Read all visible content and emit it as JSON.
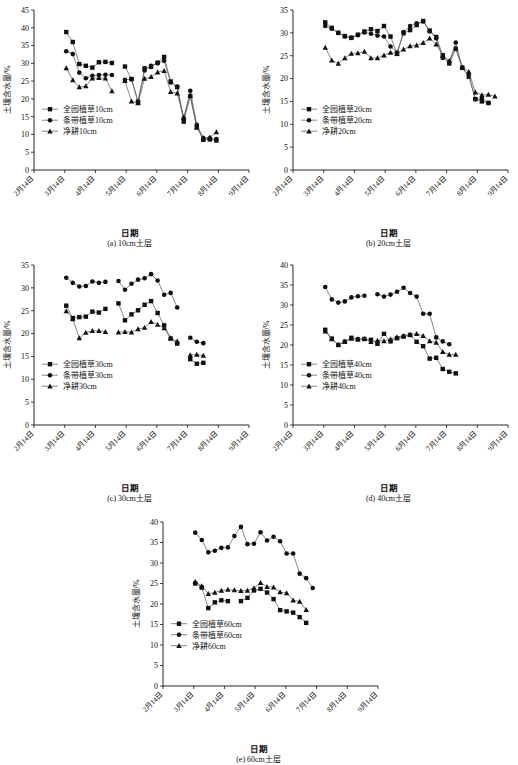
{
  "figure": {
    "axis_y_label": "土壤含水量/%",
    "axis_x_label": "日期",
    "xtick_labels": [
      "2月14日",
      "3月14日",
      "4月14日",
      "5月14日",
      "6月14日",
      "7月14日",
      "8月14日",
      "9月14日"
    ]
  },
  "chart_data": [
    {
      "type": "line",
      "panel": "a",
      "caption": "(a) 10cm土层",
      "title": "",
      "xlabel": "日期",
      "ylabel": "土壤含水量/%",
      "ylim": [
        0,
        45
      ],
      "ytick_step": 5,
      "grid": false,
      "legend_position": "lower-left",
      "categories": [
        "2月14日",
        "3月14日",
        "4月14日",
        "5月14日",
        "6月14日",
        "7月14日",
        "8月14日",
        "9月14日"
      ],
      "x": [
        1.12,
        1.33,
        1.55,
        1.78,
        2.0,
        2.22,
        2.45,
        2.68,
        2.9,
        3.12,
        3.35,
        3.6,
        3.82,
        4.45,
        4.62,
        4.82,
        5.0,
        5.22,
        5.42,
        5.6,
        5.82,
        6.05,
        6.3,
        6.55,
        6.78,
        7.1,
        7.35,
        7.6,
        7.85
      ],
      "series": [
        {
          "name": "全园植草10cm",
          "marker": "square",
          "values": [
            38.8,
            36.0,
            29.8,
            29.3,
            28.8,
            30.3,
            30.4,
            30.1,
            null,
            29.1,
            25.6,
            19.0,
            28.6,
            29.0,
            30.2,
            31.8,
            24.9,
            23.3,
            13.6,
            20.8,
            12.0,
            8.5,
            8.6,
            8.3,
            null,
            null,
            null,
            null,
            null
          ]
        },
        {
          "name": "条带植草10cm",
          "marker": "circle",
          "values": [
            33.4,
            32.6,
            27.4,
            25.8,
            26.5,
            26.7,
            26.8,
            26.7,
            null,
            25.4,
            25.5,
            19.3,
            28.0,
            29.3,
            30.0,
            30.7,
            24.6,
            23.5,
            14.5,
            22.3,
            12.7,
            9.0,
            8.9,
            8.7,
            null,
            null,
            null,
            null,
            null
          ]
        },
        {
          "name": "净耕10cm",
          "marker": "triangle",
          "values": [
            28.7,
            25.3,
            23.3,
            23.6,
            25.8,
            25.9,
            25.8,
            22.2,
            null,
            25.1,
            19.3,
            18.8,
            25.7,
            26.2,
            27.5,
            27.9,
            22.0,
            21.6,
            14.8,
            20.9,
            12.0,
            9.0,
            9.2,
            10.7,
            null,
            null,
            null,
            null,
            null
          ]
        }
      ]
    },
    {
      "type": "line",
      "panel": "b",
      "caption": "(b) 20cm土层",
      "title": "",
      "xlabel": "日期",
      "ylabel": "土壤含水量/%",
      "ylim": [
        0,
        35
      ],
      "ytick_step": 5,
      "grid": false,
      "legend_position": "lower-left",
      "categories": [
        "2月14日",
        "3月14日",
        "4月14日",
        "5月14日",
        "6月14日",
        "7月14日",
        "8月14日",
        "9月14日"
      ],
      "series": [
        {
          "name": "全园植草20cm",
          "marker": "square",
          "values": [
            32.3,
            31.1,
            30.0,
            29.3,
            28.9,
            29.6,
            30.3,
            30.8,
            30.4,
            31.5,
            29.2,
            25.4,
            29.9,
            30.6,
            31.7,
            32.6,
            30.5,
            29.1,
            25.1,
            23.3,
            26.5,
            22.4,
            20.4,
            15.5,
            15.0,
            14.7,
            null,
            null,
            null
          ]
        },
        {
          "name": "条带植草20cm",
          "marker": "circle",
          "values": [
            31.5,
            30.9,
            30.0,
            29.2,
            29.0,
            29.5,
            30.1,
            29.8,
            29.4,
            29.2,
            27.0,
            25.7,
            30.2,
            31.5,
            32.1,
            32.5,
            30.3,
            28.8,
            24.5,
            23.6,
            27.9,
            22.3,
            20.8,
            15.5,
            15.6,
            14.6,
            null,
            null,
            null
          ]
        },
        {
          "name": "净耕20cm",
          "marker": "triangle",
          "values": [
            26.8,
            24.0,
            23.3,
            24.5,
            25.5,
            25.6,
            25.9,
            24.5,
            24.5,
            25.1,
            25.7,
            25.4,
            26.4,
            27.1,
            27.3,
            27.8,
            28.8,
            27.5,
            25.1,
            23.9,
            26.6,
            22.4,
            21.5,
            17.0,
            16.4,
            16.5,
            16.1,
            null,
            null
          ]
        }
      ]
    },
    {
      "type": "line",
      "panel": "c",
      "caption": "(c) 30cm土层",
      "title": "",
      "xlabel": "日期",
      "ylabel": "土壤含水量/%",
      "ylim": [
        0,
        35
      ],
      "ytick_step": 5,
      "grid": false,
      "legend_position": "lower-left",
      "categories": [
        "2月14日",
        "3月14日",
        "4月14日",
        "5月14日",
        "6月14日",
        "7月14日",
        "8月14日",
        "9月14日"
      ],
      "series": [
        {
          "name": "全园植草30cm",
          "marker": "square",
          "values": [
            26.1,
            23.4,
            23.6,
            23.7,
            24.8,
            24.6,
            25.4,
            null,
            26.6,
            22.9,
            24.2,
            25.1,
            26.3,
            27.1,
            24.5,
            21.8,
            18.9,
            17.8,
            null,
            14.4,
            13.4,
            13.6,
            null,
            null,
            null,
            null,
            null,
            null,
            null
          ]
        },
        {
          "name": "条带植草30cm",
          "marker": "circle",
          "values": [
            32.2,
            31.1,
            30.3,
            30.4,
            31.4,
            31.1,
            31.3,
            null,
            31.5,
            29.6,
            30.9,
            31.8,
            32.1,
            33.0,
            31.6,
            28.5,
            28.9,
            25.7,
            null,
            19.1,
            18.2,
            17.9,
            null,
            null,
            null,
            null,
            null,
            null,
            null
          ]
        },
        {
          "name": "净耕30cm",
          "marker": "triangle",
          "values": [
            24.9,
            23.2,
            19.0,
            20.2,
            20.6,
            20.6,
            20.4,
            null,
            20.3,
            20.4,
            20.3,
            21.0,
            21.3,
            22.6,
            22.0,
            21.2,
            19.0,
            18.3,
            null,
            15.3,
            15.4,
            15.2,
            null,
            null,
            null,
            null,
            null,
            null,
            null
          ]
        }
      ]
    },
    {
      "type": "line",
      "panel": "d",
      "caption": "(d) 40cm土层",
      "title": "",
      "xlabel": "日期",
      "ylabel": "土壤含水量/%",
      "ylim": [
        0,
        40
      ],
      "ytick_step": 5,
      "grid": false,
      "legend_position": "lower-left",
      "categories": [
        "2月14日",
        "3月14日",
        "4月14日",
        "5月14日",
        "6月14日",
        "7月14日",
        "8月14日",
        "9月14日"
      ],
      "series": [
        {
          "name": "全园植草40cm",
          "marker": "square",
          "values": [
            23.8,
            21.6,
            20.0,
            20.8,
            21.8,
            21.4,
            21.5,
            21.3,
            20.3,
            22.8,
            20.9,
            21.7,
            22.1,
            22.5,
            20.8,
            19.7,
            16.6,
            16.8,
            14.0,
            13.3,
            12.9,
            null,
            null,
            null,
            null,
            null,
            null,
            null,
            null
          ]
        },
        {
          "name": "条带植草40cm",
          "marker": "circle",
          "values": [
            34.5,
            31.4,
            30.6,
            30.9,
            31.9,
            32.2,
            32.3,
            null,
            32.7,
            32.1,
            32.6,
            33.3,
            34.3,
            33.0,
            32.1,
            27.8,
            27.8,
            21.9,
            20.9,
            20.2,
            null,
            null,
            null,
            null,
            null,
            null,
            null,
            null,
            null
          ]
        },
        {
          "name": "净耕40cm",
          "marker": "triangle",
          "values": [
            23.4,
            21.5,
            20.1,
            20.9,
            21.6,
            21.5,
            21.6,
            20.8,
            21.1,
            21.0,
            21.5,
            22.0,
            22.3,
            22.6,
            22.8,
            22.3,
            21.0,
            20.6,
            18.3,
            17.6,
            17.6,
            null,
            null,
            null,
            null,
            null,
            null,
            null,
            null
          ]
        }
      ]
    },
    {
      "type": "line",
      "panel": "e",
      "caption": "(e) 60cm土层",
      "title": "",
      "xlabel": "日期",
      "ylabel": "土壤含水量/%",
      "ylim": [
        0,
        40
      ],
      "ytick_step": 5,
      "grid": false,
      "legend_position": "lower-left",
      "categories": [
        "2月14日",
        "3月14日",
        "4月14日",
        "5月14日",
        "6月14日",
        "7月14日",
        "8月14日",
        "9月14日"
      ],
      "series": [
        {
          "name": "全园植草60cm",
          "marker": "square",
          "values": [
            25.0,
            24.0,
            19.0,
            20.4,
            20.9,
            20.7,
            null,
            20.7,
            21.5,
            23.3,
            23.7,
            22.8,
            21.2,
            18.5,
            18.2,
            17.9,
            16.8,
            15.4,
            null,
            null,
            null,
            null,
            null,
            null,
            null,
            null,
            null,
            null,
            null
          ]
        },
        {
          "name": "条带植草60cm",
          "marker": "circle",
          "values": [
            37.4,
            35.6,
            32.6,
            33.0,
            33.7,
            33.8,
            36.6,
            38.8,
            34.6,
            34.7,
            37.5,
            35.5,
            36.4,
            35.3,
            32.3,
            32.3,
            27.4,
            26.3,
            23.9,
            null,
            null,
            null,
            null,
            null,
            null,
            null,
            null,
            null,
            null
          ]
        },
        {
          "name": "净耕60cm",
          "marker": "triangle",
          "values": [
            25.4,
            24.4,
            22.5,
            22.8,
            23.3,
            23.5,
            23.4,
            23.2,
            23.3,
            23.9,
            25.2,
            24.2,
            24.1,
            22.9,
            22.7,
            20.9,
            20.6,
            18.6,
            null,
            null,
            null,
            null,
            null,
            null,
            null,
            null,
            null,
            null,
            null
          ]
        }
      ]
    }
  ]
}
